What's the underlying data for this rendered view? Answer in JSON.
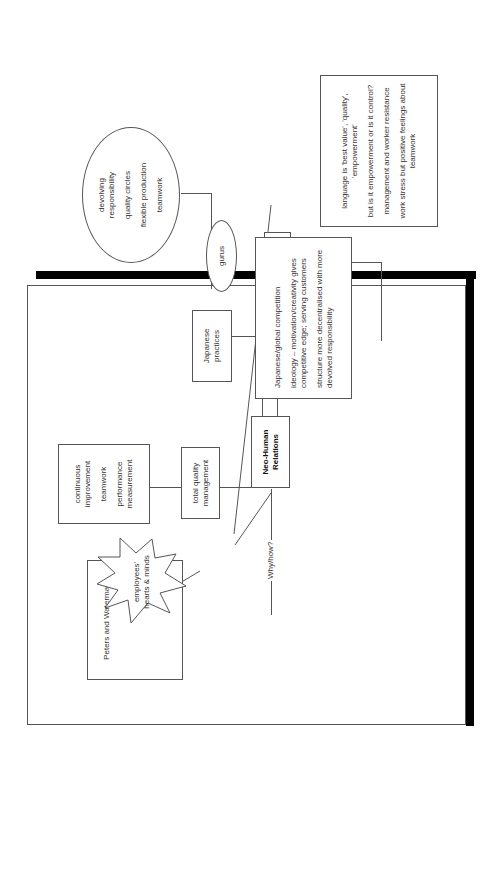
{
  "diagram": {
    "orientation": "rotated -90deg (landscape page viewed in portrait)",
    "central_node": {
      "line1": "Neo-Human",
      "line2": "Relations"
    },
    "tqm": {
      "label_line1": "total quality",
      "label_line2": "management"
    },
    "tqm_details": {
      "item1_line1": "continuous",
      "item1_line2": "improvement",
      "item2": "teamwork",
      "item3_line1": "performance",
      "item3_line2": "measurement"
    },
    "japanese": {
      "line1": "Japanese",
      "line2": "practices"
    },
    "japanese_details": {
      "item1_line1": "devolving",
      "item1_line2": "responsibility",
      "item2": "quality circles",
      "item3": "flexible production",
      "item4": "teamwork"
    },
    "critique": {
      "label": "critique"
    },
    "critique_details": {
      "item1_line1": "language is 'best value', 'quality',",
      "item1_line2": "'empowerment'",
      "item2": "but is it empowerment or is it control?",
      "item3": "management and worker resistance",
      "item4_line1": "work stress but positive feelings about",
      "item4_line2": "teamwork"
    },
    "gurus": {
      "label": "gurus"
    },
    "peters": {
      "title": "Peters and Waterman:",
      "burst_line1": "employees'",
      "burst_line2": "hearts & minds"
    },
    "whyhow": {
      "label": "Why/how?"
    },
    "whyhow_details": {
      "item1": "Japanese/global competition",
      "item2_line1": "ideology – motivation/creativity gives",
      "item2_line2": "competitive edge; serving customers",
      "item3_line1": "structure more decentralised with more",
      "item3_line2": "devolved responsibility"
    }
  },
  "colors": {
    "stroke": "#555555",
    "text": "#333333",
    "shadow": "#000000",
    "background": "#ffffff"
  }
}
